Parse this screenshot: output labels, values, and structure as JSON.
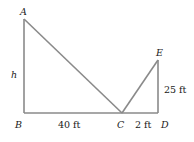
{
  "diagram": {
    "points": {
      "A": {
        "label": "A",
        "x": 24,
        "y": 19
      },
      "B": {
        "label": "B",
        "x": 24,
        "y": 113
      },
      "C": {
        "label": "C",
        "x": 122,
        "y": 113
      },
      "D": {
        "label": "D",
        "x": 158,
        "y": 113
      },
      "E": {
        "label": "E",
        "x": 158,
        "y": 60
      }
    },
    "measurements": {
      "h": "h",
      "BC": "40 ft",
      "CD": "2 ft",
      "DE": "25 ft"
    },
    "line_color": "#8a8a8a"
  }
}
